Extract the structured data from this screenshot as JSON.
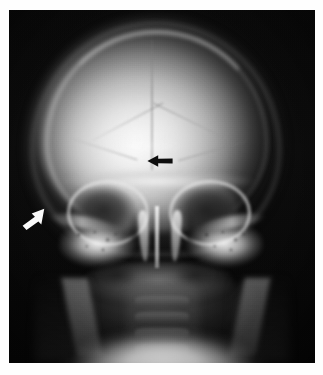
{
  "figure": {
    "kind": "radiograph",
    "modality": "plain film X-ray",
    "body_region": "skull",
    "projection": "anteroposterior (AP) frontal view",
    "orientation": "frontal, patient facing viewer",
    "caption": "",
    "background_color": "#ffffff",
    "film_color": "#0a0a0a",
    "width_px": 323,
    "height_px": 375
  },
  "film": {
    "left_px": 9,
    "top_px": 10,
    "width_px": 306,
    "height_px": 353,
    "border_margin": "white paper margin surrounding the radiograph on all four sides",
    "exposure": "high-contrast, overexposed at the inferior mandible/teeth, dark at the periphery"
  },
  "annotations": [
    {
      "id": "arrow-black-lesion",
      "name": "black-arrow",
      "color": "#0a0a0a",
      "fill_hex": "#0d0d0d",
      "direction": "pointing left",
      "angle_deg": 180,
      "tip_x": 146,
      "tip_y": 154,
      "tail_x": 174,
      "tail_y": 154,
      "length_px": 28,
      "points_at": "lucent defect within the right parietal cranial vault",
      "on_background": "bright cranial vault"
    },
    {
      "id": "arrow-white-margin",
      "name": "white-arrow",
      "color": "#ffffff",
      "fill_hex": "#fafafa",
      "direction": "pointing upper-right (northeast)",
      "angle_deg": -42,
      "tip_x": 45,
      "tip_y": 209,
      "tail_x": 21,
      "tail_y": 231,
      "length_px": 32,
      "points_at": "left lateral skull margin at the greater wing of sphenoid / temporal region",
      "on_background": "dark soft-tissue and background"
    }
  ],
  "anatomy": {
    "structures": [
      {
        "name": "cranial vault",
        "appearance": "large bright ovoid dome occupying the upper two-thirds of the film"
      },
      {
        "name": "sagittal suture",
        "appearance": "faint vertical midline lucent line in the vault"
      },
      {
        "name": "coronal suture",
        "appearance": "paired oblique lucent lines descending laterally from the midline"
      },
      {
        "name": "lambdoid suture",
        "appearance": "faint oblique lines in the lower vault"
      },
      {
        "name": "orbit, left",
        "appearance": "dark oval with a bright sclerotic bony rim"
      },
      {
        "name": "orbit, right",
        "appearance": "dark oval with a bright sclerotic bony rim"
      },
      {
        "name": "supraorbital ridge",
        "appearance": "bright horizontal band above the orbits"
      },
      {
        "name": "nasal septum",
        "appearance": "bright vertical midline strip below the orbits"
      },
      {
        "name": "nasal turbinates",
        "appearance": "paired curved bright structures flanking the septum"
      },
      {
        "name": "petrous ridge, left",
        "appearance": "dense bright mottled mass lateral to the left orbit"
      },
      {
        "name": "petrous ridge, right",
        "appearance": "dense bright mottled mass lateral to the right orbit"
      },
      {
        "name": "zygomatic arch",
        "appearance": "thin bright curved bands laterally"
      },
      {
        "name": "maxillary sinus",
        "appearance": "paired dark lucent cavities below the orbits"
      },
      {
        "name": "mandible",
        "appearance": "broad grey arc across the lower film with vertical rami"
      },
      {
        "name": "cervical spine",
        "appearance": "stacked grey vertebral bodies in the midline lower film"
      },
      {
        "name": "teeth / chin",
        "appearance": "overexposed bright white band at the inferior border"
      },
      {
        "name": "scalp soft tissue",
        "appearance": "grey halo outlining the skull against the dark background"
      }
    ]
  }
}
